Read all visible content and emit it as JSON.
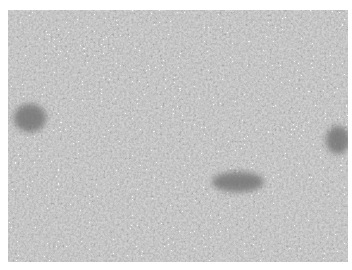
{
  "image": {
    "description": "Grayscale micrograph of densely packed cellular tissue with speckled texture and a few darker elongated vessel-like regions",
    "colors": {
      "background": "#ffffff",
      "tissue_mid": "#8a8a8a",
      "tissue_dark": "#5e5e5e",
      "tissue_light": "#e8e8e8"
    },
    "dark_regions": [
      {
        "label": "left-vessel",
        "cx": 22,
        "cy": 108,
        "rx": 16,
        "ry": 14
      },
      {
        "label": "center-vessel",
        "cx": 230,
        "cy": 172,
        "rx": 26,
        "ry": 10
      },
      {
        "label": "right-vessel",
        "cx": 330,
        "cy": 130,
        "rx": 12,
        "ry": 14
      }
    ]
  }
}
